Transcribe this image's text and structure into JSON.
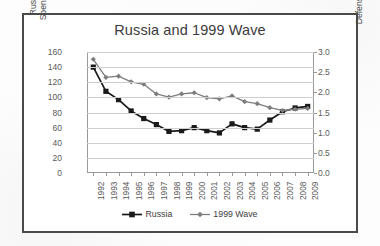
{
  "figure": {
    "title": "Russia and 1999 Wave"
  },
  "axes": {
    "left": {
      "label_line1": "Russian Military",
      "label_line2": "Spending ($million",
      "ticks": [
        "160",
        "140",
        "120",
        "100",
        "80",
        "60",
        "40",
        "20",
        "0"
      ]
    },
    "right": {
      "label": "Defense as % GDP",
      "ticks": [
        "3.0",
        "2.5",
        "2.0",
        "1.5",
        "1.0",
        "0.5",
        "0.0"
      ]
    },
    "x": {
      "ticks": [
        "1992",
        "1993",
        "1994",
        "1995",
        "1996",
        "1997",
        "1998",
        "1999",
        "2000",
        "2001",
        "2002",
        "2003",
        "2004",
        "2005",
        "2006",
        "2007",
        "2008",
        "2009"
      ]
    }
  },
  "legend": {
    "items": [
      {
        "label": "Russia",
        "marker": "square",
        "color": "#1a1a1a"
      },
      {
        "label": "1999 Wave",
        "marker": "diamond",
        "color": "#7d7d7d"
      }
    ]
  },
  "chart_data": {
    "type": "line",
    "title": "Russia and 1999 Wave",
    "xlabel": "",
    "ylabel": "Russian Military Spending ($million",
    "y2label": "Defense as % GDP",
    "grid": true,
    "legend_position": "bottom",
    "categories": [
      "1992",
      "1993",
      "1994",
      "1995",
      "1996",
      "1997",
      "1998",
      "1999",
      "2000",
      "2001",
      "2002",
      "2003",
      "2004",
      "2005",
      "2006",
      "2007",
      "2008",
      "2009"
    ],
    "ylim": [
      0,
      160
    ],
    "ytick_step": 20,
    "y2lim": [
      0.0,
      3.0
    ],
    "y2tick_step": 0.5,
    "series": [
      {
        "name": "Russia",
        "axis": "left",
        "color": "#1a1a1a",
        "marker": "square",
        "units": "$million",
        "values": [
          140,
          108,
          97,
          82,
          72,
          64,
          55,
          56,
          60,
          56,
          53,
          65,
          60,
          58,
          70,
          81,
          86,
          88
        ]
      },
      {
        "name": "1999 Wave",
        "axis": "right",
        "color": "#7d7d7d",
        "marker": "diamond",
        "units": "% GDP",
        "values": [
          2.82,
          2.37,
          2.4,
          2.26,
          2.2,
          1.96,
          1.88,
          1.96,
          1.99,
          1.87,
          1.84,
          1.91,
          1.77,
          1.72,
          1.62,
          1.55,
          1.58,
          1.6
        ]
      }
    ]
  }
}
